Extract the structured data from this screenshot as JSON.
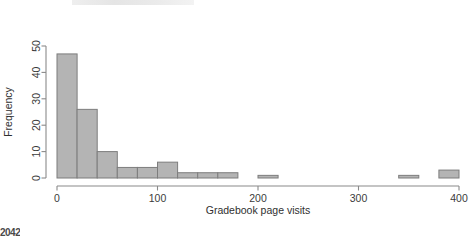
{
  "figure": {
    "width": 475,
    "height": 239,
    "background": "#ffffff",
    "bar_fill": "#b4b4b4",
    "bar_stroke": "#7d7d7d",
    "axis_color": "#8a8a8a"
  },
  "artifacts": {
    "bottom_left_text": "2042"
  },
  "chart_data": {
    "type": "bar",
    "title": "",
    "subtitle": "",
    "xlabel": "Gradebook page visits",
    "ylabel": "Frequency",
    "xlim": [
      0,
      400
    ],
    "ylim": [
      0,
      50
    ],
    "xticks": [
      0,
      100,
      200,
      300,
      400
    ],
    "xticklabels": [
      "0",
      "100",
      "200",
      "300",
      "400"
    ],
    "yticks": [
      0,
      10,
      20,
      30,
      40,
      50
    ],
    "yticklabels": [
      "0",
      "10",
      "20",
      "30",
      "40",
      "50"
    ],
    "grid": false,
    "legend": null,
    "bin_width": 20,
    "bin_edges": [
      0,
      20,
      40,
      60,
      80,
      100,
      120,
      140,
      160,
      180,
      200,
      220,
      240,
      260,
      280,
      300,
      320,
      340,
      360,
      380,
      400
    ],
    "categories": [
      "0-20",
      "20-40",
      "40-60",
      "60-80",
      "80-100",
      "100-120",
      "120-140",
      "140-160",
      "160-180",
      "180-200",
      "200-220",
      "220-240",
      "240-260",
      "260-280",
      "280-300",
      "300-320",
      "320-340",
      "340-360",
      "360-380",
      "380-400"
    ],
    "values": [
      47,
      26,
      10,
      4,
      4,
      6,
      2,
      2,
      2,
      0,
      1,
      0,
      0,
      0,
      0,
      0,
      0,
      1,
      0,
      3
    ]
  }
}
